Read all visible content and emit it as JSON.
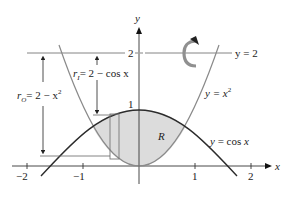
{
  "figure": {
    "axes": {
      "x_label": "x",
      "y_label": "y",
      "x_ticks": [
        "−2",
        "−1",
        "1",
        "2"
      ],
      "y_ticks": [
        "1",
        "2"
      ]
    },
    "curves": [
      {
        "label": "y = x²",
        "label_base": "y = x",
        "sup": "2"
      },
      {
        "label": "y = cos x",
        "label_base": "y = cos x"
      },
      {
        "label": "y = 2",
        "label_base": "y = 2"
      }
    ],
    "region_label": "R",
    "radii": {
      "outer": {
        "sym": "r",
        "sub": "O",
        "expr": "= 2 − x",
        "sup": "2"
      },
      "inner": {
        "sym": "r",
        "sub": "I",
        "expr": "= 2 − cos x"
      }
    },
    "rotation_icon": "rotate-around-axis-arrow",
    "colors": {
      "curve_dark": "#2b2b2b",
      "curve_gray": "#8a8a8a",
      "shade": "#dcdcdc",
      "rotation_arrow": "#909090"
    }
  }
}
